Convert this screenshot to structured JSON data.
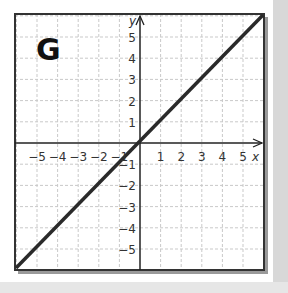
{
  "chart_data": {
    "type": "line",
    "title": "G",
    "xlabel": "x",
    "ylabel": "y",
    "xlim": [
      -6,
      6
    ],
    "ylim": [
      -6,
      6
    ],
    "grid": true,
    "x_ticks": [
      "-5",
      "-4",
      "-3",
      "-2",
      "-1",
      "1",
      "2",
      "3",
      "4",
      "5"
    ],
    "y_ticks": [
      "5",
      "4",
      "3",
      "2",
      "1",
      "-1",
      "-2",
      "-3",
      "-4",
      "-5"
    ],
    "series": [
      {
        "name": "y = x",
        "x": [
          -6,
          6
        ],
        "y": [
          -6,
          6
        ]
      }
    ]
  },
  "panel": {
    "label": "G"
  },
  "axes": {
    "x_label": "x",
    "y_label": "y"
  },
  "ticks": {
    "x": [
      "−5",
      "−4",
      "−3",
      "−2",
      "−1",
      "1",
      "2",
      "3",
      "4",
      "5"
    ],
    "y_pos": [
      "5",
      "4",
      "3",
      "2",
      "1"
    ],
    "y_neg": [
      "−1",
      "−2",
      "−3",
      "−4",
      "−5"
    ]
  }
}
